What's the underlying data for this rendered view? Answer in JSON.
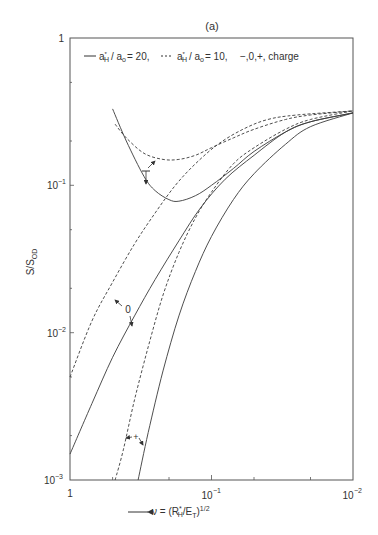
{
  "chart_data": {
    "type": "line",
    "title": "(a)",
    "xlabel": "← ν = (R*H/ET)^1/2",
    "ylabel": "S/S_OD",
    "x_scale": "log",
    "y_scale": "log",
    "xlim": [
      1,
      0.01
    ],
    "ylim": [
      0.001,
      1
    ],
    "x_ticks": [
      "1",
      "10⁻¹",
      "10⁻²"
    ],
    "y_ticks": [
      "10⁻³",
      "10⁻²",
      "10⁻¹",
      "1"
    ],
    "grid": false,
    "legend": {
      "position": "top-left inside",
      "entries": [
        {
          "style": "solid",
          "label": "a*H / a0 = 20"
        },
        {
          "style": "dashed",
          "label": "a*H / a0 = 10"
        },
        {
          "style": "text",
          "label": "−,0,+, charge"
        }
      ]
    },
    "annotations": [
      {
        "text": "−",
        "near_nu": 0.3,
        "near_y": 0.12
      },
      {
        "text": "0",
        "near_nu": 0.55,
        "near_y": 0.012
      },
      {
        "text": "+",
        "near_nu": 0.26,
        "near_y": 0.0018
      }
    ],
    "series": [
      {
        "name": "a*H/a0=20, charge −",
        "style": "solid",
        "x": [
          0.5,
          0.4,
          0.3,
          0.25,
          0.2,
          0.17,
          0.13,
          0.1,
          0.07,
          0.05,
          0.03,
          0.02,
          0.01
        ],
        "y": [
          0.33,
          0.2,
          0.115,
          0.092,
          0.08,
          0.078,
          0.085,
          0.1,
          0.13,
          0.17,
          0.23,
          0.27,
          0.31
        ]
      },
      {
        "name": "a*H/a0=10, charge −",
        "style": "dashed",
        "x": [
          0.48,
          0.4,
          0.3,
          0.22,
          0.17,
          0.13,
          0.1,
          0.07,
          0.05,
          0.03,
          0.02,
          0.01
        ],
        "y": [
          0.26,
          0.21,
          0.165,
          0.15,
          0.15,
          0.16,
          0.18,
          0.21,
          0.24,
          0.28,
          0.3,
          0.32
        ]
      },
      {
        "name": "a*H/a0=20, charge 0",
        "style": "solid",
        "x": [
          1,
          0.7,
          0.5,
          0.35,
          0.25,
          0.17,
          0.12,
          0.08,
          0.05,
          0.03,
          0.02,
          0.01
        ],
        "y": [
          0.0015,
          0.0033,
          0.0068,
          0.013,
          0.023,
          0.042,
          0.07,
          0.11,
          0.16,
          0.23,
          0.27,
          0.31
        ]
      },
      {
        "name": "a*H/a0=10, charge 0",
        "style": "dashed",
        "x": [
          1,
          0.7,
          0.5,
          0.35,
          0.25,
          0.18,
          0.13,
          0.09,
          0.06,
          0.04,
          0.025,
          0.01
        ],
        "y": [
          0.005,
          0.012,
          0.022,
          0.04,
          0.065,
          0.1,
          0.14,
          0.19,
          0.24,
          0.28,
          0.3,
          0.32
        ]
      },
      {
        "name": "a*H/a0=20, charge +",
        "style": "solid",
        "x": [
          0.33,
          0.28,
          0.22,
          0.17,
          0.13,
          0.1,
          0.07,
          0.05,
          0.03,
          0.02,
          0.01
        ],
        "y": [
          0.001,
          0.0021,
          0.0055,
          0.013,
          0.026,
          0.045,
          0.08,
          0.12,
          0.19,
          0.25,
          0.31
        ]
      },
      {
        "name": "a*H/a0=10, charge +",
        "style": "dashed",
        "x": [
          0.48,
          0.42,
          0.35,
          0.28,
          0.22,
          0.17,
          0.13,
          0.1,
          0.07,
          0.05,
          0.03,
          0.02,
          0.01
        ],
        "y": [
          0.001,
          0.0016,
          0.0035,
          0.008,
          0.018,
          0.035,
          0.06,
          0.09,
          0.14,
          0.18,
          0.24,
          0.28,
          0.32
        ]
      }
    ]
  },
  "labels": {
    "title": "(a)",
    "legend_solid_a": "a",
    "legend_solid_sub": "H",
    "legend_solid_rest": "/ a",
    "legend_solid_sub2": "o",
    "legend_solid_val": "= 20,",
    "legend_dashed_val": "= 10,",
    "legend_charge": "−,0,+, charge",
    "ylabel_top": "S",
    "ylabel_bottom": "S",
    "ylabel_sub": "OD",
    "xlabel_nu": "ν = (R",
    "xlabel_sub": "H",
    "xlabel_rest": "/E",
    "xlabel_sub2": "T",
    "xlabel_close": ")",
    "xlabel_exp": "1/2",
    "ann_minus": "−",
    "ann_zero": "0",
    "ann_plus": "+",
    "ytick_1": "1",
    "ytick_m1_base": "10",
    "ytick_m1_exp": "−1",
    "ytick_m2_base": "10",
    "ytick_m2_exp": "−2",
    "ytick_m3_base": "10",
    "ytick_m3_exp": "−3",
    "xtick_1": "1",
    "xtick_m1_base": "10",
    "xtick_m1_exp": "−1",
    "xtick_m2_base": "10",
    "xtick_m2_exp": "−2"
  },
  "colors": {
    "line": "#3a3a3a",
    "frame": "#555555"
  }
}
